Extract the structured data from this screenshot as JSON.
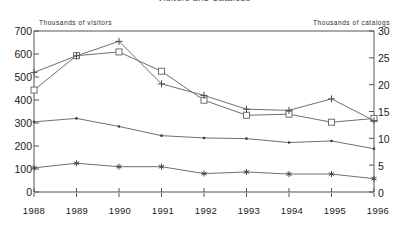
{
  "title_clipped": "Visitors and Catalogs",
  "axis": {
    "left_caption": "Thousands of visitors",
    "right_caption": "Thousands of catalogs",
    "left_ticks": [
      "700",
      "600",
      "500",
      "400",
      "300",
      "200",
      "100",
      "0"
    ],
    "right_ticks": [
      "30",
      "25",
      "20",
      "15",
      "10",
      "5",
      "0"
    ],
    "x_ticks": [
      "1988",
      "1989",
      "1990",
      "1991",
      "1992",
      "1993",
      "1994",
      "1995",
      "1996"
    ]
  },
  "chart_data": {
    "type": "line",
    "title": "",
    "xlabel": "",
    "ylabel": "Thousands of visitors",
    "y2label": "Thousands of catalogs",
    "x": [
      1988,
      1989,
      1990,
      1991,
      1992,
      1993,
      1994,
      1995,
      1996
    ],
    "categories": [
      "1988",
      "1989",
      "1990",
      "1991",
      "1992",
      "1993",
      "1994",
      "1995",
      "1996"
    ],
    "ylim": [
      0,
      700
    ],
    "y2lim": [
      0,
      30
    ],
    "grid": false,
    "legend": "none",
    "series": [
      {
        "name": "Catalogs (squares)",
        "axis": "right",
        "marker": "square",
        "values": [
          19.0,
          25.4,
          26.1,
          22.5,
          17.1,
          14.3,
          14.5,
          13.0,
          13.7
        ],
        "values_left_equivalent": [
          443,
          593,
          609,
          525,
          399,
          334,
          338,
          303,
          320
        ]
      },
      {
        "name": "Visitors (plus)",
        "axis": "left",
        "marker": "plus",
        "values": [
          520,
          592,
          655,
          470,
          420,
          360,
          355,
          405,
          310
        ]
      },
      {
        "name": "Visitors (dots)",
        "axis": "left",
        "marker": "dot",
        "values": [
          305,
          320,
          285,
          245,
          235,
          232,
          215,
          222,
          188
        ]
      },
      {
        "name": "Visitors (asterisks)",
        "axis": "left",
        "marker": "asterisk",
        "values": [
          105,
          125,
          110,
          110,
          80,
          87,
          78,
          78,
          58
        ]
      }
    ]
  }
}
